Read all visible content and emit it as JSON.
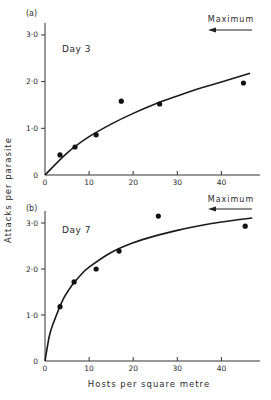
{
  "chart_data": [
    {
      "type": "scatter",
      "panel_label": "(a)",
      "title": "Day 3",
      "annotation": "Maximum",
      "annotation_arrow": "left",
      "xlabel": "",
      "ylabel": "Attacks per parasite",
      "xlim": [
        0,
        48
      ],
      "ylim": [
        0,
        3.0
      ],
      "xticks": [
        0,
        10,
        20,
        30,
        40
      ],
      "xtick_labels": [
        "0",
        "10",
        "20",
        "30",
        "40"
      ],
      "yticks": [
        0,
        1.0,
        2.0,
        3.0
      ],
      "ytick_labels": [
        "0",
        "1·0",
        "2·0",
        "3·0"
      ],
      "grid": false,
      "series": [
        {
          "name": "observed",
          "x": [
            3.4,
            6.8,
            11.6,
            17.3,
            26.0,
            45.0
          ],
          "y": [
            0.43,
            0.6,
            0.86,
            1.58,
            1.52,
            1.97
          ]
        },
        {
          "name": "fitted curve",
          "x": [
            0,
            5,
            10,
            15,
            20,
            25,
            30,
            35,
            40,
            46.5
          ],
          "y": [
            0,
            0.47,
            0.82,
            1.09,
            1.32,
            1.52,
            1.69,
            1.85,
            1.99,
            2.18
          ]
        }
      ]
    },
    {
      "type": "scatter",
      "panel_label": "(b)",
      "title": "Day 7",
      "annotation": "Maximum",
      "annotation_arrow": "left",
      "xlabel": "Hosts per square metre",
      "ylabel": "Attacks per parasite",
      "xlim": [
        0,
        48
      ],
      "ylim": [
        0,
        3.0
      ],
      "xticks": [
        0,
        10,
        20,
        30,
        40
      ],
      "xtick_labels": [
        "0",
        "10",
        "20",
        "30",
        "40"
      ],
      "yticks": [
        0,
        1.0,
        2.0,
        3.0
      ],
      "ytick_labels": [
        "0",
        "1·0",
        "2·0",
        "3·0"
      ],
      "grid": false,
      "series": [
        {
          "name": "observed",
          "x": [
            3.4,
            6.6,
            11.6,
            16.8,
            25.7,
            45.4
          ],
          "y": [
            1.18,
            1.72,
            2.0,
            2.39,
            3.15,
            2.93
          ]
        },
        {
          "name": "fitted curve",
          "x": [
            0,
            1,
            2,
            4,
            6,
            8,
            10,
            15,
            20,
            25,
            30,
            35,
            40,
            47
          ],
          "y": [
            0,
            0.55,
            0.85,
            1.32,
            1.63,
            1.86,
            2.04,
            2.36,
            2.57,
            2.72,
            2.84,
            2.94,
            3.02,
            3.11
          ]
        }
      ]
    }
  ],
  "figure": {
    "ylabel": "Attacks per parasite",
    "xlabel": "Hosts per square metre"
  }
}
